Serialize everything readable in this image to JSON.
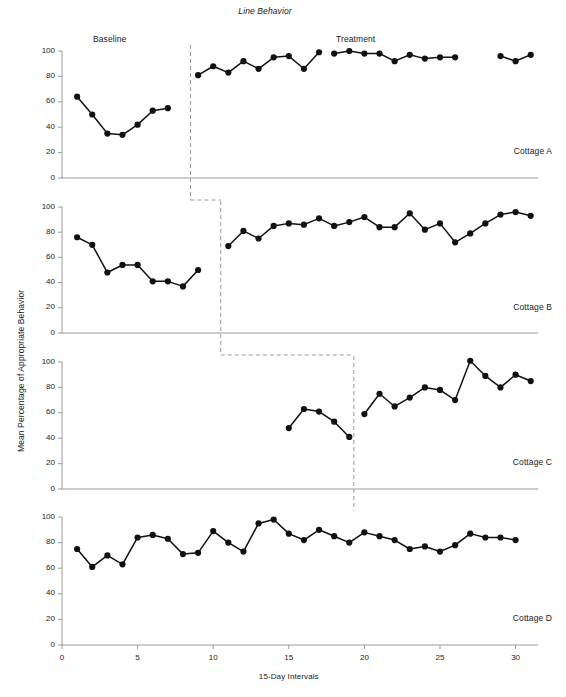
{
  "figure": {
    "title": "Line Behavior",
    "y_axis_label": "Mean Percentage of Appropriate Behavior",
    "x_axis_label": "15-Day Intervals",
    "phase_labels": {
      "baseline": "Baseline",
      "treatment": "Treatment"
    },
    "panel_labels": {
      "a": "Cottage A",
      "b": "Cottage B",
      "c": "Cottage C",
      "d": "Cottage D"
    },
    "y_ticks": [
      "0",
      "20",
      "40",
      "60",
      "80",
      "100"
    ],
    "x_ticks": [
      "0",
      "5",
      "10",
      "15",
      "20",
      "25",
      "30"
    ],
    "colors": {
      "line": "#111111",
      "marker": "#111111",
      "axis": "#9a9a9a",
      "phase_line": "#9a9a9a",
      "text": "#1a1a1a",
      "background": "#ffffff"
    }
  },
  "chart_data": {
    "type": "line",
    "title": "Line Behavior",
    "xlabel": "15-Day Intervals",
    "ylabel": "Mean Percentage of Appropriate Behavior",
    "xlim": [
      0,
      31
    ],
    "ylim": [
      0,
      105
    ],
    "xticks": [
      0,
      5,
      10,
      15,
      20,
      25,
      30
    ],
    "yticks": [
      0,
      20,
      40,
      60,
      80,
      100
    ],
    "grid": false,
    "legend": "none",
    "design": "multiple-baseline across settings",
    "panels": [
      {
        "name": "Cottage A",
        "label": "Cottage A",
        "phase_change_x": 8.5,
        "phases": [
          {
            "name": "Baseline",
            "segments": [
              {
                "x": [
                  1,
                  2,
                  3,
                  4,
                  5,
                  6,
                  7
                ],
                "y": [
                  64,
                  50,
                  35,
                  34,
                  42,
                  53,
                  55
                ]
              }
            ]
          },
          {
            "name": "Treatment",
            "segments": [
              {
                "x": [
                  9,
                  10,
                  11,
                  12,
                  13,
                  14,
                  15,
                  16,
                  17
                ],
                "y": [
                  81,
                  88,
                  83,
                  92,
                  86,
                  95,
                  96,
                  86,
                  99
                ]
              },
              {
                "x": [
                  18,
                  19,
                  20,
                  21,
                  22,
                  23,
                  24,
                  25,
                  26
                ],
                "y": [
                  98,
                  100,
                  98,
                  98,
                  92,
                  97,
                  94,
                  95,
                  95
                ]
              },
              {
                "x": [
                  29,
                  30,
                  31
                ],
                "y": [
                  96,
                  92,
                  97
                ]
              }
            ]
          }
        ]
      },
      {
        "name": "Cottage B",
        "label": "Cottage B",
        "phase_change_x": 10.5,
        "phases": [
          {
            "name": "Baseline",
            "segments": [
              {
                "x": [
                  1,
                  2,
                  3,
                  4,
                  5,
                  6,
                  7,
                  8,
                  9
                ],
                "y": [
                  76,
                  70,
                  48,
                  54,
                  54,
                  41,
                  41,
                  37,
                  50
                ]
              }
            ]
          },
          {
            "name": "Treatment",
            "segments": [
              {
                "x": [
                  11,
                  12,
                  13,
                  14,
                  15,
                  16,
                  17,
                  18,
                  19,
                  20,
                  21,
                  22,
                  23,
                  24,
                  25,
                  26,
                  27,
                  28,
                  29,
                  30,
                  31
                ],
                "y": [
                  69,
                  81,
                  75,
                  85,
                  87,
                  86,
                  91,
                  85,
                  88,
                  92,
                  84,
                  84,
                  95,
                  82,
                  87,
                  72,
                  79,
                  87,
                  94,
                  96,
                  93
                ]
              }
            ]
          }
        ]
      },
      {
        "name": "Cottage C",
        "label": "Cottage C",
        "phase_change_x": 19.3,
        "phases": [
          {
            "name": "Baseline",
            "segments": [
              {
                "x": [
                  15,
                  16,
                  17,
                  18,
                  19
                ],
                "y": [
                  48,
                  63,
                  61,
                  53,
                  41
                ]
              }
            ]
          },
          {
            "name": "Treatment",
            "segments": [
              {
                "x": [
                  20,
                  21,
                  22,
                  23,
                  24,
                  25,
                  26,
                  27,
                  28,
                  29,
                  30,
                  31
                ],
                "y": [
                  59,
                  75,
                  65,
                  72,
                  80,
                  78,
                  70,
                  101,
                  89,
                  80,
                  90,
                  85
                ]
              }
            ]
          }
        ]
      },
      {
        "name": "Cottage D",
        "label": "Cottage D",
        "phase_change_x": null,
        "phases": [
          {
            "name": "Baseline",
            "segments": [
              {
                "x": [
                  1,
                  2,
                  3,
                  4,
                  5,
                  6,
                  7,
                  8,
                  9,
                  10,
                  11,
                  12,
                  13,
                  14,
                  15,
                  16,
                  17,
                  18,
                  19,
                  20,
                  21,
                  22,
                  23,
                  24,
                  25,
                  26,
                  27,
                  28,
                  29,
                  30
                ],
                "y": [
                  75,
                  61,
                  70,
                  63,
                  84,
                  86,
                  83,
                  71,
                  72,
                  89,
                  80,
                  73,
                  95,
                  98,
                  87,
                  82,
                  90,
                  85,
                  80,
                  88,
                  85,
                  82,
                  75,
                  77,
                  73,
                  78,
                  87,
                  84,
                  84,
                  82
                ]
              }
            ]
          }
        ]
      }
    ]
  }
}
